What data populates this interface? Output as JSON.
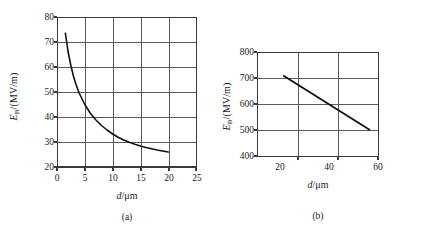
{
  "figure": {
    "panels": [
      {
        "caption": "(a)",
        "y_axis_title_main": "E",
        "y_axis_title_sub": "B",
        "y_axis_title_unit": "/(MV/m)",
        "x_axis_title_var": "d",
        "x_axis_title_unit": "/μm",
        "chart_data": {
          "type": "line",
          "title": "",
          "xlabel": "d/μm",
          "ylabel": "E_B/(MV/m)",
          "xlim": [
            0,
            25
          ],
          "ylim": [
            20,
            80
          ],
          "xticks": [
            0,
            5,
            10,
            15,
            20,
            25
          ],
          "yticks": [
            20,
            30,
            40,
            50,
            60,
            70,
            80
          ],
          "xtick_labels": [
            "0",
            "5",
            "10",
            "15",
            "20",
            "25"
          ],
          "ytick_labels": [
            "20",
            "30",
            "40",
            "50",
            "60",
            "70",
            "80"
          ],
          "grid": true,
          "legend": "none",
          "series": [
            {
              "name": "breakdown field vs gap",
              "x": [
                1.5,
                2.0,
                2.5,
                3.0,
                3.5,
                4.0,
                5.0,
                6.0,
                7.0,
                8.0,
                9.0,
                10.0,
                11.0,
                12.0,
                13.0,
                14.0,
                15.0,
                16.0,
                17.0,
                18.0,
                19.0,
                20.0
              ],
              "y": [
                73.5,
                66.0,
                60.5,
                56.0,
                52.5,
                49.5,
                45.0,
                41.5,
                38.8,
                36.6,
                34.8,
                33.2,
                31.9,
                30.8,
                29.9,
                29.1,
                28.4,
                27.8,
                27.3,
                26.8,
                26.4,
                26.0
              ]
            }
          ]
        }
      },
      {
        "caption": "(b)",
        "y_axis_title_main": "E",
        "y_axis_title_sub": "B",
        "y_axis_title_unit": "/(MV/m)",
        "x_axis_title_var": "d",
        "x_axis_title_unit": "/μm",
        "chart_data": {
          "type": "line",
          "title": "",
          "xlabel": "d/μm",
          "ylabel": "E_B/(MV/m)",
          "xlim": [
            0,
            60
          ],
          "ylim": [
            400,
            800
          ],
          "xticks": [
            20,
            40,
            60
          ],
          "yticks": [
            400,
            500,
            600,
            700,
            800
          ],
          "xtick_labels": [
            "20",
            "40",
            "60"
          ],
          "ytick_labels": [
            "400",
            "500",
            "600",
            "700",
            "800"
          ],
          "grid": true,
          "legend": "none",
          "series": [
            {
              "name": "breakdown field vs gap",
              "x": [
                13.0,
                56.0
              ],
              "y": [
                710.0,
                500.0
              ]
            }
          ]
        }
      }
    ],
    "colors": {
      "axis": "#3a3a3a",
      "grid": "#555555",
      "curve": "#111111",
      "background": "#ffffff",
      "text": "#1a1a1a"
    }
  }
}
